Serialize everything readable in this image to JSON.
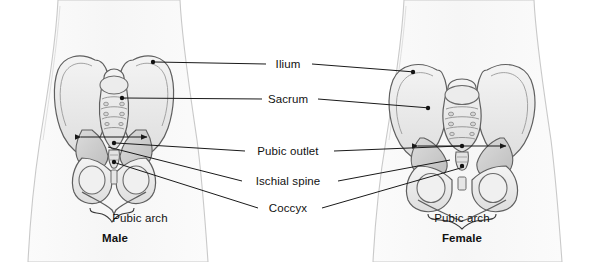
{
  "figure": {
    "background_color": "#ffffff",
    "bone_fill": "#e9e9e9",
    "bone_fill_light": "#f2f2f2",
    "bone_fill_dark": "#d2d2d2",
    "outline_color": "#5a5a5a",
    "body_outline_color": "#c8c8c8",
    "leader_color": "#1a1a1a",
    "text_color": "#111111"
  },
  "callouts": [
    {
      "id": "ilium",
      "label": "Ilium",
      "x": 288,
      "y": 65,
      "anchor": "middle"
    },
    {
      "id": "sacrum",
      "label": "Sacrum",
      "x": 288,
      "y": 100,
      "anchor": "middle"
    },
    {
      "id": "pubic-outlet",
      "label": "Pubic outlet",
      "x": 288,
      "y": 152,
      "anchor": "middle"
    },
    {
      "id": "ischial-spine",
      "label": "Ischial spine",
      "x": 288,
      "y": 182,
      "anchor": "middle"
    },
    {
      "id": "coccyx",
      "label": "Coccyx",
      "x": 288,
      "y": 210,
      "anchor": "middle"
    }
  ],
  "panels": [
    {
      "id": "male",
      "sex_label": "Male",
      "sex_label_x": 115,
      "sex_label_y": 238,
      "arch_label": "Pubic arch",
      "arch_label_x": 140,
      "arch_label_y": 218,
      "arch_shape": "narrow V-shaped subpubic angle",
      "outlet_width_px": 66
    },
    {
      "id": "female",
      "sex_label": "Female",
      "sex_label_x": 462,
      "sex_label_y": 238,
      "arch_label": "Pubic arch",
      "arch_label_x": 462,
      "arch_label_y": 218,
      "arch_shape": "wide U-shaped subpubic angle",
      "outlet_width_px": 88
    }
  ]
}
